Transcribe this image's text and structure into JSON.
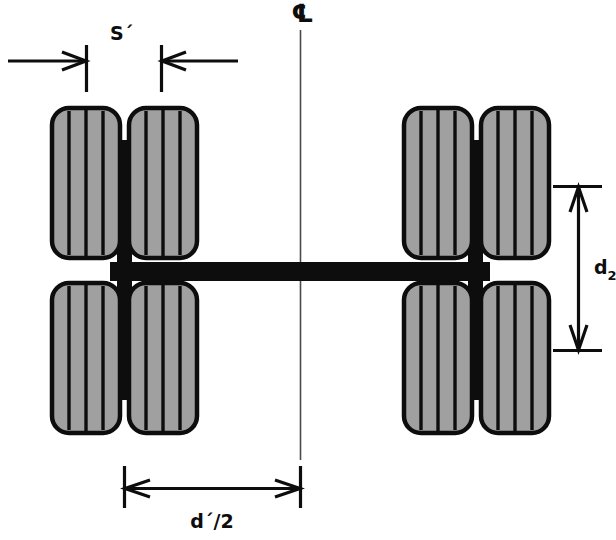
{
  "diagram": {
    "centerline_symbol": "℄",
    "labels": {
      "spacing_s": "S´",
      "track_d2": "d",
      "track_d2_subscript": "2",
      "half_spacing": "d´/2"
    },
    "colors": {
      "tire_fill": "#a0a0a0",
      "outline": "#0d0d0d",
      "axle": "#0d0d0d",
      "centerline": "#4a4a4a",
      "background": "#ffffff"
    },
    "geometry": {
      "centerline_x": 300,
      "tire_width": 68,
      "tire_height": 150,
      "tread_lines_per_tire": 3,
      "wheel_groups": 2,
      "tires_per_group": 4
    },
    "dimensions": [
      {
        "name": "S´",
        "type": "horizontal",
        "description": "gap between the inner edges of the two left-hand tires"
      },
      {
        "name": "d2",
        "type": "vertical",
        "description": "center-to-center distance between the front and rear axles"
      },
      {
        "name": "d´/2",
        "type": "horizontal",
        "description": "half of the transverse distance from wheel group centroid to the vehicle centerline"
      }
    ]
  }
}
